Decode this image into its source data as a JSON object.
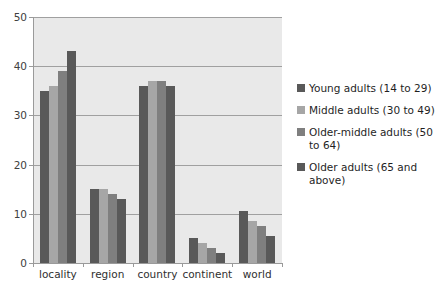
{
  "chart_data": {
    "type": "bar",
    "title": "",
    "subtitle": "",
    "xlabel": "",
    "ylabel": "",
    "categories": [
      "locality",
      "region",
      "country",
      "continent",
      "world"
    ],
    "series": [
      {
        "name": "Young adults (14 to 29)",
        "color": "#595959",
        "values": [
          35,
          15,
          36,
          5,
          10.5
        ]
      },
      {
        "name": "Middle adults (30 to 49)",
        "color": "#a6a6a6",
        "values": [
          36,
          15,
          37,
          4,
          8.5
        ]
      },
      {
        "name": "Older-middle adults (50 to 64)",
        "color": "#7f7f7f",
        "values": [
          39,
          14,
          37,
          3,
          7.5
        ]
      },
      {
        "name": "Older adults (65 and above)",
        "color": "#595959",
        "values": [
          43,
          13,
          36,
          2,
          5.5
        ]
      }
    ],
    "ylim": [
      0,
      50
    ],
    "yticks": [
      0,
      10,
      20,
      30,
      40,
      50
    ],
    "ytick_labels": [
      "0",
      "10",
      "20",
      "30",
      "40",
      "50"
    ],
    "grid": true,
    "grid_axis": "y",
    "legend_position": "right",
    "plot_background": "#e9e9e9",
    "figure_background": "#ffffff",
    "grid_color": "#a0a0a0",
    "axis_color": "#9a9a9a"
  },
  "legend": {
    "items": [
      "Young adults (14 to 29)",
      "Middle adults (30 to 49)",
      "Older-middle adults (50 to 64)",
      "Older adults (65 and above)"
    ]
  }
}
